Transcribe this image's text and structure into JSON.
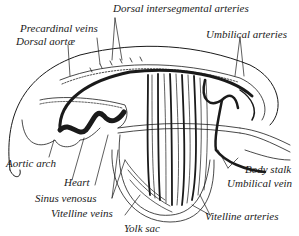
{
  "figure": {
    "colors": {
      "ink": "#1a1a1a",
      "background": "#ffffff"
    }
  },
  "labels": {
    "dorsal_intersegmental_arteries": "Dorsal intersegmental arteries",
    "precardinal_veins": "Precardinal veins",
    "dorsal_aortae": "Dorsal aortæ",
    "umbilical_arteries": "Umbilical arteries",
    "aortic_arch": "Aortic arch",
    "heart": "Heart",
    "sinus_venosus": "Sinus venosus",
    "vitelline_veins": "Vitelline veins",
    "yolk_sac": "Yolk sac",
    "body_stalk": "Body stalk",
    "umbilical_vein": "Umbilical vein",
    "vitelline_arteries": "Vitelline arteries"
  }
}
